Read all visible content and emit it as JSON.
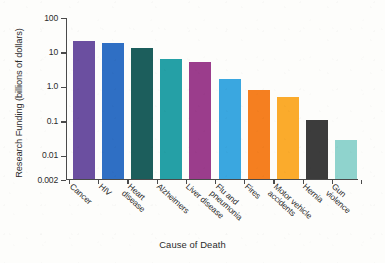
{
  "chart_data": {
    "type": "bar",
    "title": "",
    "xlabel": "Cause of Death",
    "ylabel": "Research Funding (billions of dollars)",
    "yscale": "log",
    "ylim": [
      0.002,
      100
    ],
    "ytick_labels": [
      "100",
      "10",
      "1.0",
      "0.1",
      "0.01",
      "0.002"
    ],
    "ytick_values": [
      100,
      10,
      1.0,
      0.1,
      0.01,
      0.002
    ],
    "grid": false,
    "legend": null,
    "categories": [
      "Cancer",
      "HIV",
      "Heart disease",
      "Alzheimers",
      "Liver disease",
      "Flu and pneumonia",
      "Fires",
      "Motor vehicle accidents",
      "Hernia",
      "Gun violence"
    ],
    "values": [
      20,
      18,
      13,
      6,
      5,
      1.6,
      0.8,
      0.48,
      0.105,
      0.027
    ],
    "colors": [
      "#6b4fa0",
      "#2f6fc4",
      "#1c5e5c",
      "#25a0a6",
      "#9b3d8c",
      "#3aa7e0",
      "#f57f20",
      "#fbab2c",
      "#3c3c3c",
      "#8fd3cd"
    ],
    "bars": [
      {
        "label": "Cancer",
        "label_lines": "Cancer",
        "value": 20,
        "color": "#6b4fa0"
      },
      {
        "label": "HIV",
        "label_lines": "HIV",
        "value": 18,
        "color": "#2f6fc4"
      },
      {
        "label": "Heart disease",
        "label_lines": "Heart\ndisease",
        "value": 13,
        "color": "#1c5e5c"
      },
      {
        "label": "Alzheimers",
        "label_lines": "Alzheimers",
        "value": 6,
        "color": "#25a0a6"
      },
      {
        "label": "Liver disease",
        "label_lines": "Liver disease",
        "value": 5,
        "color": "#9b3d8c"
      },
      {
        "label": "Flu and pneumonia",
        "label_lines": "Flu and\npneumonia",
        "value": 1.6,
        "color": "#3aa7e0"
      },
      {
        "label": "Fires",
        "label_lines": "Fires",
        "value": 0.8,
        "color": "#f57f20"
      },
      {
        "label": "Motor vehicle accidents",
        "label_lines": "Motor vehicle\naccidents",
        "value": 0.48,
        "color": "#fbab2c"
      },
      {
        "label": "Hernia",
        "label_lines": "Hernia",
        "value": 0.105,
        "color": "#3c3c3c"
      },
      {
        "label": "Gun violence",
        "label_lines": "Gun violence",
        "value": 0.027,
        "color": "#8fd3cd"
      }
    ]
  },
  "footer": {
    "caption": ""
  }
}
